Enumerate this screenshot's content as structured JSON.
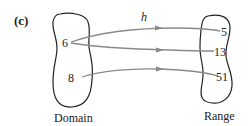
{
  "diagram": {
    "part_label": "(c)",
    "function_name": "h",
    "domain": {
      "label": "Domain",
      "elements": [
        "6",
        "8"
      ]
    },
    "range": {
      "label": "Range",
      "elements": [
        "5",
        "13",
        "51"
      ]
    },
    "mappings": [
      {
        "from": "6",
        "to": "5"
      },
      {
        "from": "6",
        "to": "13"
      },
      {
        "from": "8",
        "to": "51"
      }
    ],
    "colors": {
      "arrow": "#8a8a8a",
      "outline": "#222222",
      "text": "#222222"
    }
  }
}
